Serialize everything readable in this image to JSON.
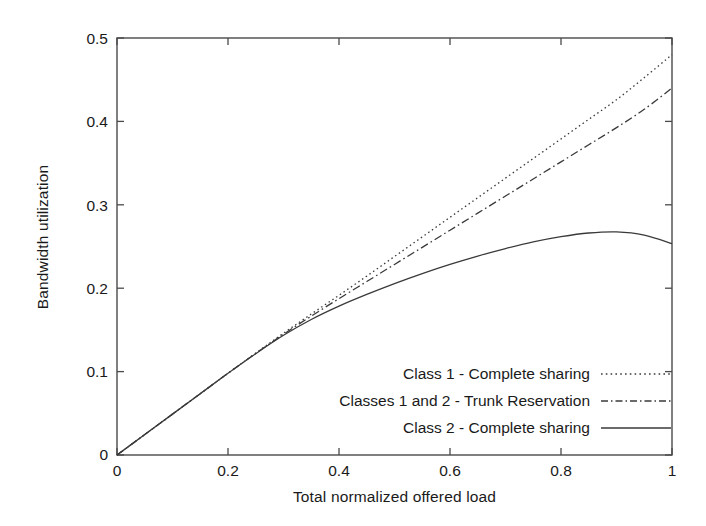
{
  "chart_data": {
    "type": "line",
    "title": "",
    "xlabel": "Total normalized offered load",
    "ylabel": "Bandwidth utilization",
    "xlim": [
      0,
      1
    ],
    "ylim": [
      0,
      0.5
    ],
    "xticks": [
      "0",
      "0.2",
      "0.4",
      "0.6",
      "0.8",
      "1"
    ],
    "xtick_values": [
      0,
      0.2,
      0.4,
      0.6,
      0.8,
      1
    ],
    "yticks": [
      "0",
      "0.1",
      "0.2",
      "0.3",
      "0.4",
      "0.5"
    ],
    "ytick_values": [
      0,
      0.1,
      0.2,
      0.3,
      0.4,
      0.5
    ],
    "grid": false,
    "legend_position": "lower-right-inside",
    "line_color": "#3a3a3a",
    "axis_color": "#4a4a4a",
    "background": "#ffffff",
    "x": [
      0,
      0.05,
      0.1,
      0.15,
      0.2,
      0.25,
      0.3,
      0.35,
      0.4,
      0.45,
      0.5,
      0.55,
      0.6,
      0.65,
      0.7,
      0.75,
      0.8,
      0.85,
      0.9,
      0.95,
      1
    ],
    "series": [
      {
        "name": "Class 1 - Complete sharing",
        "style": "dotted",
        "values": [
          0,
          0.0245,
          0.049,
          0.0735,
          0.098,
          0.1222,
          0.146,
          0.169,
          0.1915,
          0.2145,
          0.238,
          0.2615,
          0.285,
          0.3085,
          0.332,
          0.3555,
          0.379,
          0.4025,
          0.426,
          0.4525,
          0.48
        ]
      },
      {
        "name": "Classes 1 and 2 - Trunk Reservation",
        "style": "dash-dot",
        "values": [
          0,
          0.0245,
          0.049,
          0.0735,
          0.098,
          0.1218,
          0.1448,
          0.1665,
          0.1875,
          0.208,
          0.2285,
          0.249,
          0.2695,
          0.29,
          0.3105,
          0.331,
          0.3515,
          0.372,
          0.3925,
          0.4145,
          0.44
        ]
      },
      {
        "name": "Class 2 - Complete sharing",
        "style": "solid",
        "values": [
          0,
          0.0245,
          0.049,
          0.0735,
          0.098,
          0.1215,
          0.1435,
          0.1625,
          0.1785,
          0.1925,
          0.2055,
          0.2175,
          0.2285,
          0.2385,
          0.2475,
          0.2555,
          0.2618,
          0.2662,
          0.2675,
          0.2637,
          0.2535
        ]
      }
    ]
  },
  "legend": {
    "entries": [
      {
        "label": "Class 1 - Complete sharing",
        "style": "dotted"
      },
      {
        "label": "Classes 1 and 2 - Trunk Reservation",
        "style": "dash-dot"
      },
      {
        "label": "Class 2 - Complete sharing",
        "style": "solid"
      }
    ]
  }
}
